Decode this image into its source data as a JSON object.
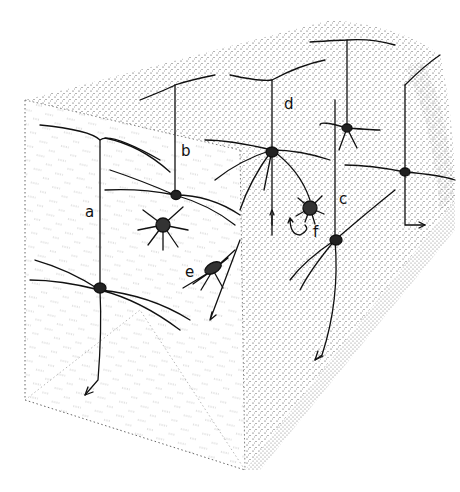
{
  "figure": {
    "labels": {
      "a": "a",
      "b": "b",
      "c": "c",
      "d": "d",
      "e": "e",
      "f": "f"
    },
    "colors": {
      "ink": "#111111",
      "stipple": "#333333",
      "background": "#ffffff"
    }
  }
}
